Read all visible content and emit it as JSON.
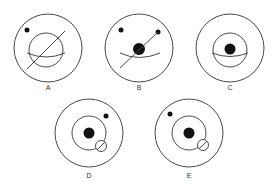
{
  "figures": [
    {
      "id": "A",
      "label": "A"
    },
    {
      "id": "B",
      "label": "B"
    },
    {
      "id": "C",
      "label": "C"
    },
    {
      "id": "D",
      "label": "D"
    },
    {
      "id": "E",
      "label": "E"
    }
  ],
  "colors": {
    "stroke": "#4a4a4a",
    "fill": "#111111",
    "background": "#ffffff"
  }
}
